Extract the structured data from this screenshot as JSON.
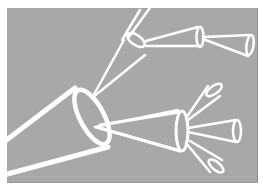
{
  "illustration": {
    "subject": "branching white line-art cones (megaphone / telescope shapes) on gray background",
    "colors": {
      "background": "#a8a8a8",
      "page": "#ffffff",
      "stroke": "#ffffff"
    },
    "elements": [
      {
        "name": "large-cone",
        "position": "lower-left",
        "opening": "left"
      },
      {
        "name": "upper-branch-cone",
        "position": "top-center",
        "children": 2
      },
      {
        "name": "lower-branch-cone",
        "position": "center-right",
        "children": 3
      }
    ]
  }
}
